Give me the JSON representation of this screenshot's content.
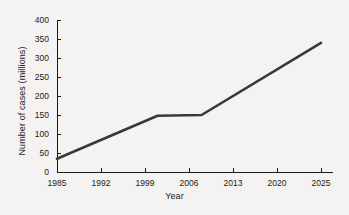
{
  "chart_data": {
    "type": "line",
    "title": "",
    "xlabel": "Year",
    "ylabel": "Number of cases (millions)",
    "x_tick_labels": [
      "1985",
      "1992",
      "1999",
      "2006",
      "2013",
      "2020",
      "2025"
    ],
    "y_tick_labels": [
      "0",
      "50",
      "100",
      "150",
      "200",
      "250",
      "300",
      "350",
      "400"
    ],
    "ylim": [
      0,
      400
    ],
    "y_tick_step": 50,
    "grid": false,
    "legend": null,
    "x_axis_spacing": "even",
    "series": [
      {
        "name": "Number of cases",
        "color": "#39393b",
        "points": [
          {
            "year": 1985,
            "value": 35
          },
          {
            "year": 2001,
            "value": 148
          },
          {
            "year": 2008,
            "value": 150
          },
          {
            "year": 2025,
            "value": 340
          }
        ]
      }
    ]
  },
  "figure": {
    "background_color": "#f4f3f1",
    "axis_color": "#1b1b1b"
  }
}
